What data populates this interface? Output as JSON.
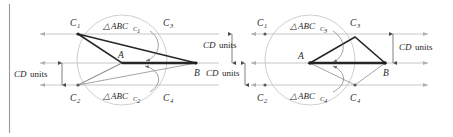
{
  "figure": {
    "background_color": "#ffffff",
    "border_color": "#9a9a9e",
    "axis_color": "#b9b9bd",
    "circle_color": "#c2c2c6",
    "strong_stroke_color": "#262626",
    "faint_stroke_color": "#8e8e92"
  },
  "left_panel": {
    "vertices": {
      "A": "A",
      "B": "B",
      "C1": "C",
      "C1_sub": "1",
      "C2": "C",
      "C2_sub": "2",
      "C3": "C",
      "C3_sub": "3",
      "C4": "C",
      "C4_sub": "4"
    },
    "triangle_labels": [
      {
        "prefix": "△",
        "body": "ABC",
        "sub": "1"
      },
      {
        "prefix": "△",
        "body": "ABC",
        "sub": "2"
      }
    ],
    "dimensions": [
      {
        "italic": "CD",
        "rest": " units"
      }
    ]
  },
  "right_panel": {
    "vertices": {
      "A": "A",
      "B": "B",
      "C1": "C",
      "C1_sub": "1",
      "C2": "C",
      "C2_sub": "2",
      "C3": "C",
      "C3_sub": "3",
      "C4": "C",
      "C4_sub": "4"
    },
    "triangle_labels": [
      {
        "prefix": "△",
        "body": "ABC",
        "sub": "3"
      },
      {
        "prefix": "△",
        "body": "ABC",
        "sub": "4"
      }
    ],
    "dimensions": [
      {
        "italic": "CD",
        "rest": " units"
      }
    ]
  },
  "center_dimensions": [
    {
      "italic": "CD",
      "rest": " units"
    },
    {
      "italic": "CD",
      "rest": " units"
    }
  ],
  "text": {
    "cd_italic": "CD",
    "units_word": " units",
    "delta": "△",
    "abc": "ABC",
    "letter_A": "A",
    "letter_B": "B",
    "letter_C": "C",
    "sub_1": "1",
    "sub_2": "2",
    "sub_3": "3",
    "sub_4": "4"
  },
  "geometry_values": {
    "left_circle_center_x": 122,
    "left_circle_center_y": 60,
    "left_circle_radius": 45,
    "right_circle_center_x": 310,
    "right_circle_center_y": 60,
    "right_circle_radius": 45,
    "line_y_top": 34,
    "line_y_mid": 63,
    "line_y_bottom": 85
  }
}
